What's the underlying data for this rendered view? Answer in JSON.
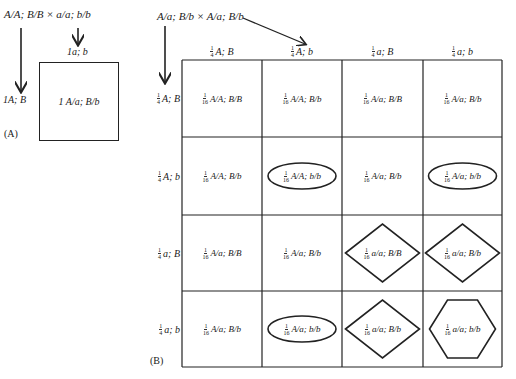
{
  "panel_a": {
    "label": "(A)",
    "cross": "A/A; B/B × a/a; b/b",
    "col_gamete": "1a; b",
    "row_gamete": "1A; B",
    "cell": "1 A/a; B/b"
  },
  "panel_b": {
    "label": "(B)",
    "cross": "A/a; B/b × A/a; B/b",
    "fraction_header": {
      "num": "1",
      "den": "4"
    },
    "fraction_cell": {
      "num": "1",
      "den": "16"
    },
    "col_gametes": [
      "A; B",
      "A; b",
      "a; B",
      "a; b"
    ],
    "row_gametes": [
      "A; B",
      "A; b",
      "a; B",
      "a; b"
    ],
    "cells": [
      [
        {
          "text": "A/A; B/B",
          "shape": "none"
        },
        {
          "text": "A/A; B/b",
          "shape": "none"
        },
        {
          "text": "A/a; B/B",
          "shape": "none"
        },
        {
          "text": "A/a; B/b",
          "shape": "none"
        }
      ],
      [
        {
          "text": "A/A; B/b",
          "shape": "none"
        },
        {
          "text": "A/A; b/b",
          "shape": "ellipse"
        },
        {
          "text": "A/a; B/b",
          "shape": "none"
        },
        {
          "text": "A/a; b/b",
          "shape": "ellipse"
        }
      ],
      [
        {
          "text": "A/a; B/B",
          "shape": "none"
        },
        {
          "text": "A/a; B/b",
          "shape": "none"
        },
        {
          "text": "a/a; B/B",
          "shape": "diamond"
        },
        {
          "text": "a/a; B/b",
          "shape": "diamond"
        }
      ],
      [
        {
          "text": "A/a; B/b",
          "shape": "none"
        },
        {
          "text": "A/a; b/b",
          "shape": "ellipse"
        },
        {
          "text": "a/a; B/b",
          "shape": "diamond"
        },
        {
          "text": "a/a; b/b",
          "shape": "hexagon"
        }
      ]
    ]
  }
}
